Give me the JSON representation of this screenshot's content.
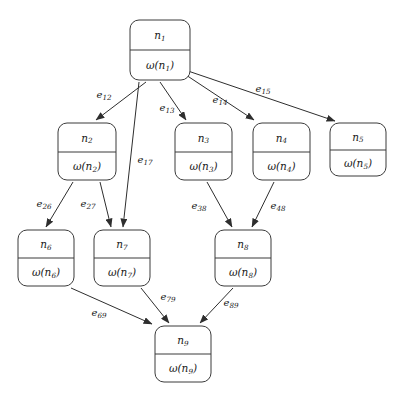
{
  "diagram": {
    "background_color": "#ffffff",
    "node_stroke_color": "#3b3b3b",
    "edge_stroke_color": "#2e2e2e",
    "text_color": "#1a1a1a",
    "weight_symbol": "ω",
    "nodes": [
      {
        "key": "n1",
        "id_base": "n",
        "id_sub": "1",
        "weight_prefix": "ω(",
        "weight_base": "n",
        "weight_sub": "1",
        "weight_suffix": ")",
        "x": 130,
        "y": 20,
        "w": 60,
        "h": 60,
        "divider_y": 50
      },
      {
        "key": "n2",
        "id_base": "n",
        "id_sub": "2",
        "weight_prefix": "ω(",
        "weight_base": "n",
        "weight_sub": "2",
        "weight_suffix": ")",
        "x": 58,
        "y": 123,
        "w": 58,
        "h": 57,
        "divider_y": 152
      },
      {
        "key": "n3",
        "id_base": "n",
        "id_sub": "3",
        "weight_prefix": "ω(",
        "weight_base": "n",
        "weight_sub": "3",
        "weight_suffix": ")",
        "x": 175,
        "y": 123,
        "w": 57,
        "h": 57,
        "divider_y": 152
      },
      {
        "key": "n4",
        "id_base": "n",
        "id_sub": "4",
        "weight_prefix": "ω(",
        "weight_base": "n",
        "weight_sub": "4",
        "weight_suffix": ")",
        "x": 253,
        "y": 123,
        "w": 57,
        "h": 57,
        "divider_y": 152
      },
      {
        "key": "n5",
        "id_base": "n",
        "id_sub": "5",
        "weight_prefix": "ω(",
        "weight_base": "n",
        "weight_sub": "5",
        "weight_suffix": ")",
        "x": 330,
        "y": 123,
        "w": 56,
        "h": 53,
        "divider_y": 150
      },
      {
        "key": "n6",
        "id_base": "n",
        "id_sub": "6",
        "weight_prefix": "ω(",
        "weight_base": "n",
        "weight_sub": "6",
        "weight_suffix": ")",
        "x": 18,
        "y": 230,
        "w": 56,
        "h": 56,
        "divider_y": 258
      },
      {
        "key": "n7",
        "id_base": "n",
        "id_sub": "7",
        "weight_prefix": "ω(",
        "weight_base": "n",
        "weight_sub": "7",
        "weight_suffix": ")",
        "x": 94,
        "y": 230,
        "w": 56,
        "h": 56,
        "divider_y": 258
      },
      {
        "key": "n8",
        "id_base": "n",
        "id_sub": "8",
        "weight_prefix": "ω(",
        "weight_base": "n",
        "weight_sub": "8",
        "weight_suffix": ")",
        "x": 215,
        "y": 230,
        "w": 56,
        "h": 56,
        "divider_y": 258
      },
      {
        "key": "n9",
        "id_base": "n",
        "id_sub": "9",
        "weight_prefix": "ω(",
        "weight_base": "n",
        "weight_sub": "9",
        "weight_suffix": ")",
        "x": 155,
        "y": 326,
        "w": 56,
        "h": 56,
        "divider_y": 354
      }
    ],
    "edges": [
      {
        "key": "e12",
        "from": "n1",
        "to": "n2",
        "label_base": "e",
        "label_sub": "12",
        "x1": 146,
        "y1": 82,
        "x2": 96,
        "y2": 120,
        "lx": 104,
        "ly": 95
      },
      {
        "key": "e13",
        "from": "n1",
        "to": "n3",
        "label_base": "e",
        "label_sub": "13",
        "x1": 160,
        "y1": 82,
        "x2": 186,
        "y2": 120,
        "lx": 167,
        "ly": 108
      },
      {
        "key": "e14",
        "from": "n1",
        "to": "n4",
        "label_base": "e",
        "label_sub": "14",
        "x1": 186,
        "y1": 75,
        "x2": 254,
        "y2": 120,
        "lx": 220,
        "ly": 100
      },
      {
        "key": "e15",
        "from": "n1",
        "to": "n5",
        "label_base": "e",
        "label_sub": "15",
        "x1": 188,
        "y1": 71,
        "x2": 335,
        "y2": 121,
        "lx": 263,
        "ly": 89
      },
      {
        "key": "e17",
        "from": "n1",
        "to": "n7",
        "label_base": "e",
        "label_sub": "17",
        "x1": 139,
        "y1": 82,
        "x2": 123,
        "y2": 227,
        "lx": 145,
        "ly": 160
      },
      {
        "key": "e26",
        "from": "n2",
        "to": "n6",
        "label_base": "e",
        "label_sub": "26",
        "x1": 73,
        "y1": 182,
        "x2": 46,
        "y2": 227,
        "lx": 44,
        "ly": 204
      },
      {
        "key": "e27",
        "from": "n2",
        "to": "n7",
        "label_base": "e",
        "label_sub": "27",
        "x1": 100,
        "y1": 182,
        "x2": 111,
        "y2": 227,
        "lx": 88,
        "ly": 204
      },
      {
        "key": "e38",
        "from": "n3",
        "to": "n8",
        "label_base": "e",
        "label_sub": "38",
        "x1": 207,
        "y1": 182,
        "x2": 232,
        "y2": 227,
        "lx": 199,
        "ly": 206
      },
      {
        "key": "e48",
        "from": "n4",
        "to": "n8",
        "label_base": "e",
        "label_sub": "48",
        "x1": 274,
        "y1": 182,
        "x2": 252,
        "y2": 227,
        "lx": 278,
        "ly": 206
      },
      {
        "key": "e69",
        "from": "n6",
        "to": "n9",
        "label_base": "e",
        "label_sub": "69",
        "x1": 71,
        "y1": 288,
        "x2": 152,
        "y2": 324,
        "lx": 99,
        "ly": 313
      },
      {
        "key": "e79",
        "from": "n7",
        "to": "n9",
        "label_base": "e",
        "label_sub": "79",
        "x1": 141,
        "y1": 288,
        "x2": 169,
        "y2": 323,
        "lx": 168,
        "ly": 297
      },
      {
        "key": "e89",
        "from": "n8",
        "to": "n9",
        "label_base": "e",
        "label_sub": "89",
        "x1": 233,
        "y1": 288,
        "x2": 200,
        "y2": 323,
        "lx": 231,
        "ly": 303
      }
    ]
  }
}
